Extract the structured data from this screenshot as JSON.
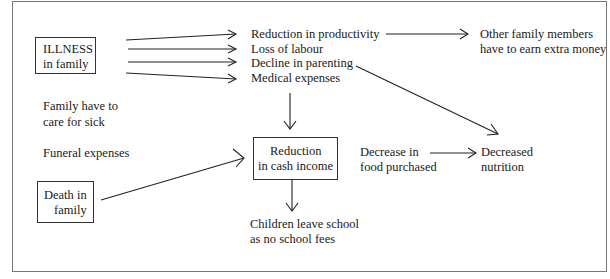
{
  "diagram": {
    "nodes": {
      "illness": {
        "line1": "ILLNESS",
        "line2": "in family"
      },
      "death": {
        "line1": "Death in",
        "line2": "family"
      },
      "reduction_productivity": "Reduction in productivity",
      "loss_labour": "Loss of labour",
      "decline_parenting": "Decline in parenting",
      "medical_expenses": "Medical expenses",
      "other_family": {
        "line1": "Other family members",
        "line2": "have to earn extra money"
      },
      "family_care": {
        "line1": "Family have to",
        "line2": "care for sick"
      },
      "funeral": "Funeral expenses",
      "cash_income": {
        "line1": "Reduction",
        "line2": "in cash income"
      },
      "decrease_food": {
        "line1": "Decrease in",
        "line2": "food purchased"
      },
      "decreased_nutrition": {
        "line1": "Decreased",
        "line2": "nutrition"
      },
      "children_school": {
        "line1": "Children leave school",
        "line2": "as no school fees"
      }
    },
    "edges": [
      [
        "illness",
        "reduction_productivity"
      ],
      [
        "illness",
        "loss_labour"
      ],
      [
        "illness",
        "decline_parenting"
      ],
      [
        "illness",
        "medical_expenses"
      ],
      [
        "reduction_productivity",
        "other_family"
      ],
      [
        "decline_parenting",
        "decreased_nutrition"
      ],
      [
        "medical_expenses",
        "cash_income"
      ],
      [
        "death",
        "cash_income"
      ],
      [
        "cash_income",
        "children_school"
      ],
      [
        "decrease_food",
        "decreased_nutrition"
      ]
    ]
  }
}
